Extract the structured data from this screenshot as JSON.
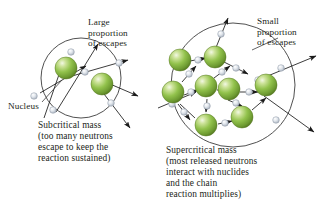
{
  "figure": {
    "type": "diagram",
    "background_color": "#ffffff"
  },
  "colors": {
    "nucleus_highlight": "#e8f2d2",
    "nucleus_mid": "#8cbf45",
    "nucleus_edge": "#5f8a2b",
    "nucleus_rim": "#4e7324",
    "neutron_light": "#eef1f5",
    "neutron_mid": "#c3cbd6",
    "neutron_edge": "#8d97a5",
    "arrow": "#1a1a1a",
    "circle_outline": "#3c3c3c",
    "text": "#231f20"
  },
  "labels": {
    "large_escapes": "Large\nproportion\nof escapes",
    "small_escapes": "Small\nproportion\nof escapes",
    "nucleus": "Nucleus"
  },
  "captions": {
    "subcritical": "Subcritical mass\n(too many neutrons\nescape to keep the\nreaction sustained)",
    "supercritical": "Supercritical mass\n(most released neutrons\ninteract with nuclides\nand the chain\nreaction multiplies)"
  },
  "diagram_data": {
    "subcritical": {
      "name": "subcritical-mass",
      "circle": {
        "cx": 81,
        "cy": 78,
        "r": 40
      },
      "nuclei": [
        {
          "cx": 66,
          "cy": 68,
          "r": 11
        },
        {
          "cx": 102,
          "cy": 84,
          "r": 11
        }
      ],
      "neutron_count": 6,
      "escaping_arrows": 6
    },
    "supercritical": {
      "name": "supercritical-mass",
      "circle": {
        "cx": 233,
        "cy": 85,
        "r": 62
      },
      "nuclei": [
        {
          "cx": 215,
          "cy": 57,
          "r": 11
        },
        {
          "cx": 180,
          "cy": 60,
          "r": 11
        },
        {
          "cx": 173,
          "cy": 92,
          "r": 11
        },
        {
          "cx": 206,
          "cy": 86,
          "r": 11
        },
        {
          "cx": 229,
          "cy": 89,
          "r": 11
        },
        {
          "cx": 266,
          "cy": 85,
          "r": 11
        },
        {
          "cx": 206,
          "cy": 125,
          "r": 11
        },
        {
          "cx": 242,
          "cy": 117,
          "r": 11
        }
      ],
      "neutron_count": 16,
      "escaping_arrows": 4
    }
  }
}
